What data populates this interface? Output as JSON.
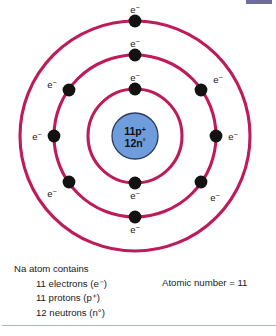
{
  "figure": {
    "background_color": "#ffffff",
    "ring_color": "#bd1b5c",
    "electron_color": "#121212",
    "nucleus_fill": "#6f9cda",
    "nucleus_stroke": "#2b3a66",
    "rule_color": "#e2a0b8",
    "corner_mark_color": "#55548c"
  },
  "nucleus": {
    "protons_line": "11p",
    "protons_charge": "+",
    "neutrons_line": "12n",
    "neutrons_charge": "°",
    "radius": 23,
    "center_x": 135,
    "center_y": 136
  },
  "shells": [
    {
      "name": "shell-1",
      "radius": 47,
      "electron_count": 2
    },
    {
      "name": "shell-2",
      "radius": 81,
      "electron_count": 8
    },
    {
      "name": "shell-3",
      "radius": 115,
      "electron_count": 1
    }
  ],
  "electron_label": {
    "symbol": "e",
    "charge": "−"
  },
  "electrons": [
    {
      "id": "e1",
      "shell": 1,
      "angle_deg": 90,
      "cx": 135,
      "cy": 89,
      "label_x": 135,
      "label_y": 80
    },
    {
      "id": "e2",
      "shell": 1,
      "angle_deg": 270,
      "cx": 135,
      "cy": 183,
      "label_x": 135,
      "label_y": 200
    },
    {
      "id": "e3",
      "shell": 2,
      "angle_deg": 90,
      "cx": 135,
      "cy": 55,
      "label_x": 135,
      "label_y": 46
    },
    {
      "id": "e4",
      "shell": 2,
      "angle_deg": 145,
      "cx": 69,
      "cy": 90,
      "label_x": 53,
      "label_y": 88
    },
    {
      "id": "e5",
      "shell": 2,
      "angle_deg": 35,
      "cx": 201,
      "cy": 90,
      "label_x": 217,
      "label_y": 82
    },
    {
      "id": "e6",
      "shell": 2,
      "angle_deg": 180,
      "cx": 54,
      "cy": 136,
      "label_x": 38,
      "label_y": 140
    },
    {
      "id": "e7",
      "shell": 2,
      "angle_deg": 0,
      "cx": 216,
      "cy": 136,
      "label_x": 232,
      "label_y": 140
    },
    {
      "id": "e8",
      "shell": 2,
      "angle_deg": 215,
      "cx": 69,
      "cy": 182,
      "label_x": 53,
      "label_y": 196
    },
    {
      "id": "e9",
      "shell": 2,
      "angle_deg": 325,
      "cx": 201,
      "cy": 182,
      "label_x": 214,
      "label_y": 200
    },
    {
      "id": "e10",
      "shell": 2,
      "angle_deg": 270,
      "cx": 135,
      "cy": 217,
      "label_x": 135,
      "label_y": 234
    },
    {
      "id": "e11",
      "shell": 3,
      "angle_deg": 90,
      "cx": 135,
      "cy": 21,
      "label_x": 135,
      "label_y": 14
    }
  ],
  "caption": {
    "heading": "Na atom contains",
    "items": [
      {
        "count": "11",
        "particle": "electrons",
        "symbol": "e",
        "charge": "−"
      },
      {
        "count": "11",
        "particle": "protons",
        "symbol": "p",
        "charge": "+"
      },
      {
        "count": "12",
        "particle": "neutrons",
        "symbol": "n",
        "charge": "°"
      }
    ],
    "lines": [
      "Na atom contains",
      "11 electrons (e⁻)",
      "11 protons (p⁺)",
      "12 neutrons (n°)"
    ],
    "atomic_number_label": "Atomic number = 11"
  }
}
